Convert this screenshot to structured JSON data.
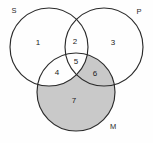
{
  "figure": {
    "type": "venn-diagram",
    "set_count": 3,
    "background_color": "#fefefe",
    "outline_color": "#2b2b2b",
    "shaded_fill_color": "#c9c9c9"
  },
  "sets": [
    {
      "id": "S",
      "label": "S",
      "label_x": 14,
      "label_y": 11,
      "cx": 49,
      "cy": 47,
      "r": 39
    },
    {
      "id": "P",
      "label": "P",
      "label_x": 139,
      "label_y": 12,
      "cx": 104,
      "cy": 47,
      "r": 39
    },
    {
      "id": "M",
      "label": "M",
      "label_x": 113,
      "label_y": 127,
      "cx": 76,
      "cy": 92,
      "r": 39
    }
  ],
  "regions": [
    {
      "number": "1",
      "x": 38,
      "y": 43,
      "shaded": false,
      "sets": "S only"
    },
    {
      "number": "2",
      "x": 75,
      "y": 42,
      "shaded": false,
      "sets": "S and P"
    },
    {
      "number": "3",
      "x": 113,
      "y": 43,
      "shaded": false,
      "sets": "P only"
    },
    {
      "number": "4",
      "x": 57,
      "y": 73,
      "shaded": false,
      "sets": "S and M"
    },
    {
      "number": "5",
      "x": 76,
      "y": 62,
      "shaded": false,
      "sets": "S and P and M"
    },
    {
      "number": "6",
      "x": 95,
      "y": 74,
      "shaded": true,
      "sets": "P and M"
    },
    {
      "number": "7",
      "x": 74,
      "y": 101,
      "shaded": true,
      "sets": "M only"
    }
  ]
}
